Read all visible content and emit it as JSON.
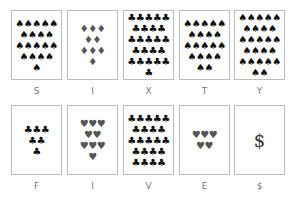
{
  "cards": [
    {
      "label": "S",
      "suit": "♠",
      "color": "black",
      "rows": [
        5,
        4,
        5,
        4,
        1
      ]
    },
    {
      "label": "I",
      "suit": "♦",
      "color": "gray",
      "rows": [
        3,
        2,
        3,
        1
      ]
    },
    {
      "label": "X",
      "suit": "♣",
      "color": "black",
      "rows": [
        5,
        4,
        5,
        4,
        5,
        1
      ]
    },
    {
      "label": "T",
      "suit": "♠",
      "color": "black",
      "rows": [
        5,
        4,
        5,
        4,
        2
      ]
    },
    {
      "label": "Y",
      "suit": "♠",
      "color": "black",
      "rows": [
        5,
        4,
        5,
        4,
        5,
        2
      ]
    },
    {
      "label": "F",
      "suit": "♣",
      "color": "black",
      "rows": [
        3,
        2,
        1
      ]
    },
    {
      "label": "I",
      "suit": "♥",
      "color": "gray",
      "rows": [
        3,
        2,
        3,
        1
      ]
    },
    {
      "label": "V",
      "suit": "♣",
      "color": "black",
      "rows": [
        5,
        4,
        5,
        4,
        4
      ]
    },
    {
      "label": "E",
      "suit": "♥",
      "color": "gray",
      "rows": [
        3,
        2
      ]
    },
    {
      "label": "$",
      "symbol": "$"
    }
  ]
}
